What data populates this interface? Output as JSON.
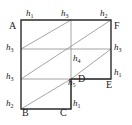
{
  "figure": {
    "type": "geometric-diagram",
    "colors": {
      "outline": "#2b2b2b",
      "grid": "#8a8a8a",
      "diagonal": "#8a8a8a",
      "label": "#1a1a1a",
      "background": "#ffffff"
    },
    "vertices": [
      {
        "name": "A",
        "label": "A",
        "x": 13,
        "y": 26
      },
      {
        "name": "F",
        "label": "F",
        "x": 119,
        "y": 26
      },
      {
        "name": "E",
        "label": "E",
        "x": 111,
        "y": 85
      },
      {
        "name": "D",
        "label": "D",
        "x": 80,
        "y": 79
      },
      {
        "name": "C",
        "label": "C",
        "x": 63,
        "y": 110
      },
      {
        "name": "B",
        "label": "B",
        "x": 24,
        "y": 110
      }
    ],
    "segment_labels": [
      {
        "name": "top-left",
        "base": "h",
        "sub": "1",
        "x": 25,
        "y": 10
      },
      {
        "name": "top-middle",
        "base": "h",
        "sub": "3",
        "x": 62,
        "y": 10
      },
      {
        "name": "top-right",
        "base": "h",
        "sub": "2",
        "x": 104,
        "y": 10
      },
      {
        "name": "left-upper",
        "base": "h",
        "sub": "3",
        "x": 4,
        "y": 42
      },
      {
        "name": "right-upper",
        "base": "h",
        "sub": "3",
        "x": 114,
        "y": 42
      },
      {
        "name": "center",
        "base": "h",
        "sub": "4",
        "x": 66,
        "y": 52
      },
      {
        "name": "left-lower",
        "base": "h",
        "sub": "3",
        "x": 4,
        "y": 69
      },
      {
        "name": "right-lower",
        "base": "h",
        "sub": "1",
        "x": 114,
        "y": 69
      },
      {
        "name": "d-corner",
        "base": "h",
        "sub": "5",
        "x": 65,
        "y": 76
      },
      {
        "name": "bottom-left",
        "base": "h",
        "sub": "2",
        "x": 4,
        "y": 96
      },
      {
        "name": "bottom-right",
        "base": "h",
        "sub": "1",
        "x": 68,
        "y": 96
      }
    ]
  }
}
